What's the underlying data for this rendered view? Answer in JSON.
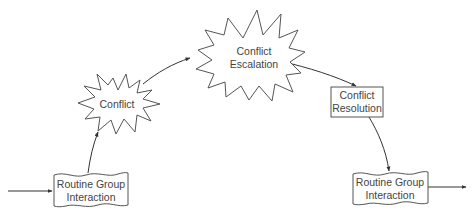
{
  "diagram": {
    "title": "",
    "type": "flow",
    "nodes": [
      {
        "id": "routine1",
        "shape": "document",
        "lines": [
          "Routine Group",
          "Interaction"
        ]
      },
      {
        "id": "conflict",
        "shape": "starburst",
        "lines": [
          "Conflict"
        ]
      },
      {
        "id": "escalation",
        "shape": "starburst",
        "lines": [
          "Conflict",
          "Escalation"
        ]
      },
      {
        "id": "resolution",
        "shape": "rectangle",
        "lines": [
          "Conflict",
          "Resolution"
        ]
      },
      {
        "id": "routine2",
        "shape": "document",
        "lines": [
          "Routine Group",
          "Interaction"
        ]
      }
    ],
    "edges": [
      {
        "from": "input",
        "to": "routine1"
      },
      {
        "from": "routine1",
        "to": "conflict"
      },
      {
        "from": "conflict",
        "to": "escalation"
      },
      {
        "from": "escalation",
        "to": "resolution"
      },
      {
        "from": "resolution",
        "to": "routine2"
      },
      {
        "from": "routine2",
        "to": "output"
      }
    ],
    "colors": {
      "stroke": "#555555",
      "text": "#444444",
      "background": "#ffffff"
    }
  }
}
